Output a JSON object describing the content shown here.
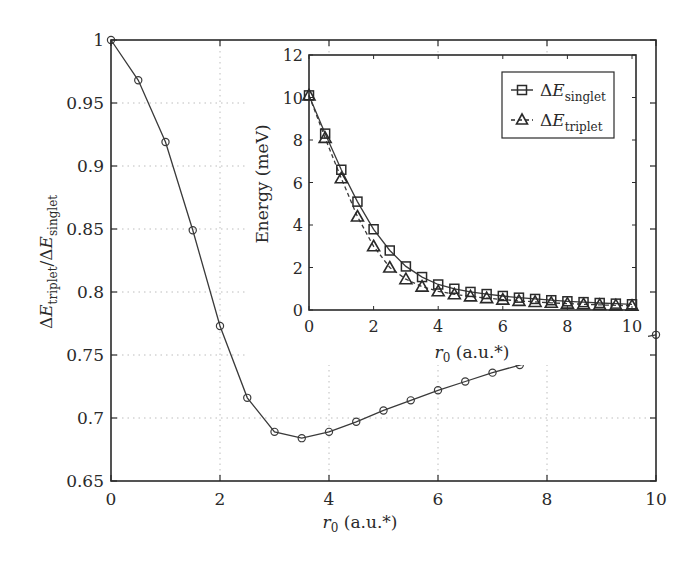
{
  "chart_data": [
    {
      "id": "main",
      "type": "line",
      "title": "",
      "xlabel_var": "r",
      "xlabel_sub": "0",
      "xlabel_unit": " (a.u.*)",
      "ylabel_parts": {
        "delta": "Δ",
        "E": "E",
        "num_sub": "triplet",
        "slash": "/",
        "den_sub": "singlet"
      },
      "xlim": [
        0,
        10
      ],
      "ylim": [
        0.65,
        1.0
      ],
      "xticks": [
        0,
        2,
        4,
        6,
        8,
        10
      ],
      "xtick_labels": [
        "0",
        "2",
        "4",
        "6",
        "8",
        "10"
      ],
      "yticks": [
        0.65,
        0.7,
        0.75,
        0.8,
        0.85,
        0.9,
        0.95,
        1.0
      ],
      "ytick_labels": [
        "0.65",
        "0.7",
        "0.75",
        "0.8",
        "0.85",
        "0.9",
        "0.95",
        "1"
      ],
      "grid": true,
      "series": [
        {
          "name": "ΔE_triplet/ΔE_singlet",
          "marker": "circle",
          "line": "solid",
          "x": [
            0,
            0.5,
            1,
            1.5,
            2,
            2.5,
            3,
            3.5,
            4,
            4.5,
            5,
            5.5,
            6,
            6.5,
            7,
            7.5,
            8,
            8.5,
            9,
            9.5,
            10
          ],
          "y": [
            1.0,
            0.968,
            0.919,
            0.849,
            0.773,
            0.716,
            0.689,
            0.684,
            0.689,
            0.697,
            0.706,
            0.714,
            0.722,
            0.729,
            0.736,
            0.742,
            0.748,
            0.753,
            0.758,
            0.762,
            0.766
          ]
        }
      ]
    },
    {
      "id": "inset",
      "type": "line",
      "title": "",
      "xlabel_var": "r",
      "xlabel_sub": "0",
      "xlabel_unit": " (a.u.*)",
      "ylabel": "Energy (meV)",
      "xlim": [
        0,
        10
      ],
      "ylim": [
        0,
        12
      ],
      "xticks": [
        0,
        2,
        4,
        6,
        8,
        10
      ],
      "xtick_labels": [
        "0",
        "2",
        "4",
        "6",
        "8",
        "10"
      ],
      "yticks": [
        0,
        2,
        4,
        6,
        8,
        10,
        12
      ],
      "ytick_labels": [
        "0",
        "2",
        "4",
        "6",
        "8",
        "10",
        "12"
      ],
      "grid": false,
      "legend_position": "top-right",
      "legend": [
        {
          "delta": "Δ",
          "E": "E",
          "sub": "singlet",
          "marker": "square",
          "line": "solid"
        },
        {
          "delta": "Δ",
          "E": "E",
          "sub": "triplet",
          "marker": "triangle",
          "line": "dashed"
        }
      ],
      "series": [
        {
          "name": "ΔE_singlet",
          "marker": "square",
          "line": "solid",
          "x": [
            0,
            0.5,
            1,
            1.5,
            2,
            2.5,
            3,
            3.5,
            4,
            4.5,
            5,
            5.5,
            6,
            6.5,
            7,
            7.5,
            8,
            8.5,
            9,
            9.5,
            10
          ],
          "y": [
            10.1,
            8.3,
            6.6,
            5.1,
            3.8,
            2.8,
            2.05,
            1.55,
            1.2,
            1.0,
            0.85,
            0.75,
            0.66,
            0.58,
            0.52,
            0.46,
            0.41,
            0.37,
            0.33,
            0.3,
            0.27
          ]
        },
        {
          "name": "ΔE_triplet",
          "marker": "triangle",
          "line": "dashed",
          "x": [
            0,
            0.5,
            1,
            1.5,
            2,
            2.5,
            3,
            3.5,
            4,
            4.5,
            5,
            5.5,
            6,
            6.5,
            7,
            7.5,
            8,
            8.5,
            9,
            9.5,
            10
          ],
          "y": [
            10.1,
            8.1,
            6.2,
            4.4,
            3.0,
            2.0,
            1.45,
            1.1,
            0.88,
            0.74,
            0.64,
            0.56,
            0.49,
            0.43,
            0.38,
            0.34,
            0.3,
            0.27,
            0.24,
            0.22,
            0.2
          ]
        }
      ]
    }
  ]
}
